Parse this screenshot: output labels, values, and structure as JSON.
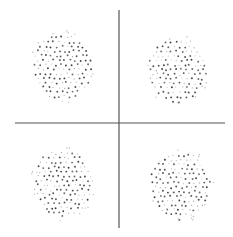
{
  "chart_data": {
    "type": "scatter",
    "title": "",
    "xlabel": "",
    "ylabel": "",
    "grid": false,
    "legend": null,
    "axes": {
      "style": "cross",
      "color": "#555555",
      "vertical": {
        "x": 119,
        "y1": 10,
        "y2": 228
      },
      "horizontal": {
        "y": 123,
        "x1": 15,
        "x2": 225
      }
    },
    "point_color": "#333333",
    "clusters": [
      {
        "name": "top-left",
        "quadrant": "II",
        "cx": 62,
        "cy": 67,
        "rx": 29,
        "ry": 34,
        "count": 140,
        "seed": 11
      },
      {
        "name": "top-right",
        "quadrant": "I",
        "cx": 177,
        "cy": 70,
        "rx": 29,
        "ry": 32,
        "count": 140,
        "seed": 23
      },
      {
        "name": "bottom-left",
        "quadrant": "III",
        "cx": 63,
        "cy": 183,
        "rx": 30,
        "ry": 34,
        "count": 145,
        "seed": 37
      },
      {
        "name": "bottom-right",
        "quadrant": "IV",
        "cx": 180,
        "cy": 185,
        "rx": 30,
        "ry": 34,
        "count": 145,
        "seed": 51
      }
    ]
  }
}
